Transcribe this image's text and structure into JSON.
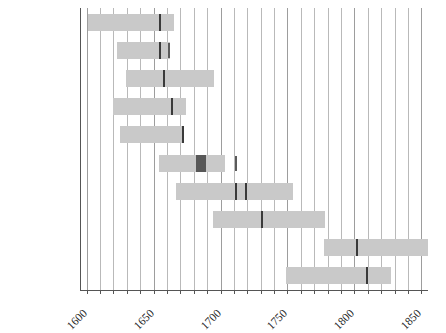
{
  "chart_data": {
    "type": "bar",
    "subtype": "timeline-range",
    "title": "",
    "subtitle": "",
    "xlabel": "",
    "ylabel": "",
    "xlim": [
      1595,
      1855
    ],
    "grid": true,
    "grid_step": 10,
    "legend": "none",
    "axis_ticks": [
      {
        "value": 1600,
        "label": "1600"
      },
      {
        "value": 1650,
        "label": "1650"
      },
      {
        "value": 1700,
        "label": "1700"
      },
      {
        "value": 1750,
        "label": "1750"
      },
      {
        "value": 1800,
        "label": "1800"
      },
      {
        "value": 1850,
        "label": "1850"
      }
    ],
    "gridline_values": [
      1600,
      1610,
      1620,
      1630,
      1640,
      1650,
      1660,
      1670,
      1680,
      1690,
      1700,
      1710,
      1720,
      1730,
      1740,
      1750,
      1760,
      1770,
      1780,
      1790,
      1800,
      1810,
      1820,
      1830,
      1840,
      1850
    ],
    "categories": [
      "Fermat",
      "Pascal",
      "Huygens",
      "Graunt",
      "de Witt",
      "J. Bernouilli",
      "de Moivre",
      "Voltaire",
      "Gauss",
      "Laplace"
    ],
    "bars": [
      {
        "name": "Fermat",
        "start": 1601,
        "end": 1665,
        "markers": [
          1654
        ],
        "blocks": [],
        "free_markers": []
      },
      {
        "name": "Pascal",
        "start": 1623,
        "end": 1662,
        "markers": [
          1654
        ],
        "blocks": [],
        "free_markers": [
          1661
        ]
      },
      {
        "name": "Huygens",
        "start": 1629,
        "end": 1695,
        "markers": [
          1657
        ],
        "blocks": [],
        "free_markers": []
      },
      {
        "name": "Graunt",
        "start": 1620,
        "end": 1674,
        "markers": [
          1663
        ],
        "blocks": [],
        "free_markers": []
      },
      {
        "name": "de Witt",
        "start": 1625,
        "end": 1672,
        "markers": [
          1671
        ],
        "blocks": [],
        "free_markers": []
      },
      {
        "name": "J. Bernouilli",
        "start": 1654,
        "end": 1703,
        "markers": [],
        "blocks": [
          {
            "start": 1682,
            "end": 1689
          }
        ],
        "free_markers": [
          1711
        ]
      },
      {
        "name": "de Moivre",
        "start": 1667,
        "end": 1754,
        "markers": [
          1711,
          1718
        ],
        "blocks": [],
        "free_markers": []
      },
      {
        "name": "Voltaire",
        "start": 1694,
        "end": 1778,
        "markers": [
          1730
        ],
        "blocks": [],
        "free_markers": []
      },
      {
        "name": "Gauss",
        "start": 1777,
        "end": 1855,
        "markers": [
          1801
        ],
        "blocks": [],
        "free_markers": []
      },
      {
        "name": "Laplace",
        "start": 1749,
        "end": 1827,
        "markers": [
          1809
        ],
        "blocks": [],
        "free_markers": []
      }
    ],
    "colors": {
      "bar": "#c9c9c9",
      "marker": "#3a3a3a",
      "block": "#585858",
      "gridline": "#b9b9b9",
      "axis": "#555555",
      "text": "#1c1c1c",
      "background": "#ffffff"
    }
  }
}
